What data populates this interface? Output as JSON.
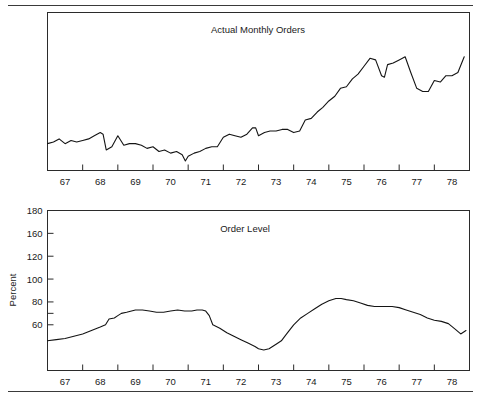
{
  "figure": {
    "rule_top": "",
    "rule_bottom": "",
    "accent_color": "#141414"
  },
  "chart_data": [
    {
      "id": "actual-monthly-orders",
      "type": "line",
      "title": "Actual Monthly Orders",
      "xlabel": "",
      "ylabel": "",
      "grid": false,
      "legend": "none",
      "xtick_labels": [
        "67",
        "68",
        "69",
        "70",
        "71",
        "72",
        "73",
        "74",
        "75",
        "76",
        "77",
        "78"
      ],
      "xlim": [
        66.5,
        78.5
      ],
      "ylim": [
        0,
        100
      ],
      "yaxis_labeled": false,
      "x": [
        66.5,
        66.67,
        66.83,
        67.0,
        67.17,
        67.33,
        67.5,
        67.67,
        67.83,
        68.0,
        68.08,
        68.17,
        68.33,
        68.5,
        68.67,
        68.83,
        69.0,
        69.17,
        69.33,
        69.5,
        69.67,
        69.83,
        70.0,
        70.17,
        70.33,
        70.42,
        70.5,
        70.67,
        70.83,
        71.0,
        71.17,
        71.33,
        71.5,
        71.67,
        71.83,
        72.0,
        72.17,
        72.33,
        72.42,
        72.5,
        72.67,
        72.83,
        73.0,
        73.17,
        73.33,
        73.5,
        73.67,
        73.83,
        74.0,
        74.17,
        74.33,
        74.5,
        74.67,
        74.83,
        75.0,
        75.17,
        75.33,
        75.5,
        75.67,
        75.83,
        76.0,
        76.08,
        76.17,
        76.33,
        76.5,
        76.67,
        76.83,
        77.0,
        77.17,
        77.33,
        77.5,
        77.67,
        77.83,
        78.0,
        78.17,
        78.35
      ],
      "values": [
        17,
        18,
        20,
        17,
        19,
        18,
        19,
        20,
        22,
        24,
        23,
        13,
        15,
        22,
        16,
        17,
        17,
        16,
        14,
        15,
        12,
        13,
        11,
        12,
        10,
        6,
        9,
        11,
        12,
        14,
        15,
        15,
        21,
        23,
        22,
        21,
        23,
        27,
        27,
        22,
        24,
        25,
        25,
        26,
        26,
        24,
        25,
        32,
        33,
        37,
        40,
        44,
        47,
        52,
        53,
        58,
        61,
        66,
        71,
        70,
        60,
        59,
        67,
        68,
        70,
        72,
        62,
        52,
        50,
        50,
        57,
        56,
        60,
        60,
        62,
        72
      ]
    },
    {
      "id": "order-level",
      "type": "line",
      "title": "Order Level",
      "xlabel": "",
      "ylabel": "Percent",
      "grid": false,
      "legend": "none",
      "xtick_labels": [
        "67",
        "68",
        "69",
        "70",
        "71",
        "72",
        "73",
        "74",
        "75",
        "76",
        "77",
        "78"
      ],
      "ytick_labels": [
        "180",
        "160",
        "120",
        "100",
        "80",
        "60"
      ],
      "ytick_values": [
        180,
        160,
        140,
        120,
        100,
        80
      ],
      "xlim": [
        66.5,
        78.5
      ],
      "ylim": [
        40,
        180
      ],
      "x": [
        66.5,
        66.75,
        67.0,
        67.25,
        67.5,
        67.75,
        68.0,
        68.15,
        68.25,
        68.4,
        68.5,
        68.6,
        68.75,
        69.0,
        69.2,
        69.4,
        69.6,
        69.8,
        70.0,
        70.2,
        70.4,
        70.6,
        70.75,
        70.9,
        71.0,
        71.1,
        71.2,
        71.4,
        71.6,
        71.8,
        72.0,
        72.2,
        72.4,
        72.5,
        72.65,
        72.8,
        73.0,
        73.15,
        73.3,
        73.5,
        73.7,
        73.9,
        74.1,
        74.3,
        74.5,
        74.7,
        74.85,
        75.0,
        75.2,
        75.4,
        75.6,
        75.8,
        76.0,
        76.15,
        76.3,
        76.5,
        76.7,
        76.9,
        77.1,
        77.3,
        77.5,
        77.7,
        77.9,
        78.1,
        78.25,
        78.4
      ],
      "values": [
        66,
        67,
        68,
        70,
        72,
        75,
        78,
        80,
        85,
        86,
        88,
        90,
        91,
        93,
        93,
        92,
        91,
        91,
        92,
        93,
        92,
        92,
        93,
        93,
        92,
        88,
        80,
        77,
        73,
        70,
        67,
        64,
        61,
        59,
        58,
        59,
        63,
        66,
        72,
        80,
        86,
        90,
        94,
        98,
        101,
        103,
        103,
        102,
        101,
        99,
        97,
        96,
        96,
        96,
        96,
        95,
        93,
        91,
        89,
        86,
        84,
        83,
        81,
        76,
        72,
        75
      ]
    }
  ]
}
